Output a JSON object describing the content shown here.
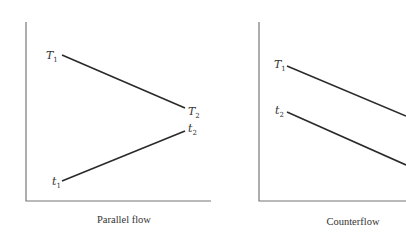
{
  "panels": [
    {
      "caption": "Parallel flow",
      "labels": {
        "hot_in": {
          "base": "T",
          "sub": "1"
        },
        "hot_out": {
          "base": "T",
          "sub": "2"
        },
        "cold_in": {
          "base": "t",
          "sub": "1"
        },
        "cold_out": {
          "base": "t",
          "sub": "2"
        }
      }
    },
    {
      "caption": "Counterflow",
      "labels": {
        "hot_in": {
          "base": "T",
          "sub": "1"
        },
        "cold_out": {
          "base": "t",
          "sub": "2"
        }
      }
    }
  ],
  "colors": {
    "line": "#2a2a2a",
    "axis": "#777777",
    "text": "#333333",
    "background": "#ffffff"
  }
}
